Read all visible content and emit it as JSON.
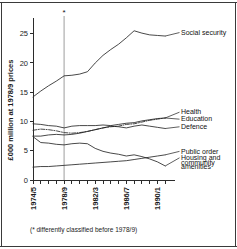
{
  "figure": {
    "footnote": "(* differently classified before 1978/9)",
    "asterisk": "*",
    "marker_note_symbol": "*"
  },
  "chart_data": {
    "type": "line",
    "title": "",
    "xlabel": "",
    "ylabel": "£000 million at 1978/9 prices",
    "xlim": [
      1974,
      1992
    ],
    "ylim": [
      0,
      27
    ],
    "yticks": [
      0,
      5,
      10,
      15,
      20,
      25
    ],
    "ytick_labels": [
      "0",
      "5",
      "10",
      "15",
      "20",
      "25"
    ],
    "x": [
      1974,
      1975,
      1976,
      1977,
      1978,
      1979,
      1980,
      1981,
      1982,
      1983,
      1984,
      1985,
      1986,
      1987,
      1988,
      1989,
      1990,
      1991
    ],
    "xtick_labels": [
      "1974/5",
      "1978/9",
      "1982/3",
      "1986/7",
      "1990/1"
    ],
    "xtick_values": [
      1974,
      1978,
      1982,
      1986,
      1990
    ],
    "grid": false,
    "legend_position": "right-inline",
    "reference_line": {
      "x": 1978,
      "label": "1978/9",
      "color": "#b9b9b9",
      "marker": "*"
    },
    "series": [
      {
        "name": "Social security",
        "style": "solid",
        "color": "#1a1a1a",
        "values": [
          14.2,
          15.2,
          16.1,
          16.9,
          17.8,
          17.9,
          18.1,
          18.5,
          20.0,
          21.3,
          22.3,
          23.2,
          24.3,
          25.5,
          25.1,
          24.8,
          24.7,
          24.6
        ]
      },
      {
        "name": "Health",
        "style": "solid",
        "color": "#1a1a1a",
        "values": [
          9.6,
          9.5,
          9.3,
          9.2,
          8.9,
          9.2,
          9.3,
          9.3,
          9.3,
          9.4,
          9.3,
          9.5,
          9.7,
          9.8,
          10.1,
          10.3,
          10.5,
          10.6
        ]
      },
      {
        "name": "Education",
        "style": "dashdot",
        "color": "#1a1a1a",
        "values": [
          8.5,
          8.7,
          8.6,
          8.4,
          8.1,
          8.0,
          8.1,
          8.3,
          8.6,
          8.9,
          9.1,
          9.2,
          9.5,
          9.6,
          9.9,
          10.2,
          10.4,
          10.6
        ]
      },
      {
        "name": "Defence",
        "style": "solid",
        "color": "#1a1a1a",
        "values": [
          7.5,
          7.5,
          7.7,
          7.8,
          7.7,
          7.8,
          8.0,
          8.3,
          8.6,
          8.9,
          9.2,
          9.1,
          8.9,
          9.2,
          9.4,
          9.2,
          9.0,
          8.8
        ]
      },
      {
        "name": "Public order",
        "style": "solid",
        "color": "#1a1a1a",
        "values": [
          2.2,
          2.3,
          2.3,
          2.4,
          2.5,
          2.6,
          2.7,
          2.8,
          2.9,
          3.0,
          3.1,
          3.2,
          3.3,
          3.5,
          3.7,
          3.9,
          4.1,
          4.3
        ]
      },
      {
        "name": "Housing and community amenities",
        "style": "solid",
        "color": "#1a1a1a",
        "values": [
          7.4,
          6.4,
          6.3,
          6.1,
          6.0,
          6.2,
          6.3,
          6.2,
          5.4,
          4.9,
          4.6,
          4.4,
          4.1,
          4.3,
          4.0,
          3.6,
          3.1,
          2.4
        ]
      }
    ],
    "annotations": [
      {
        "text": "Social security",
        "anchor_x": 1991,
        "anchor_y": 24.6,
        "label_y": 24.8
      },
      {
        "text": "Health",
        "anchor_x": 1991,
        "anchor_y": 10.6,
        "label_y": 11.2
      },
      {
        "text": "Education",
        "anchor_x": 1991,
        "anchor_y": 10.6,
        "label_y": 10.0
      },
      {
        "text": "Defence",
        "anchor_x": 1991,
        "anchor_y": 8.8,
        "label_y": 8.7
      },
      {
        "text": "Public order",
        "anchor_x": 1991,
        "anchor_y": 4.3,
        "label_y": 4.5
      },
      {
        "text": "Housing and",
        "anchor_x": 1991,
        "anchor_y": 2.4,
        "label_y": 3.4
      },
      {
        "text": "community",
        "anchor_x": null,
        "anchor_y": null,
        "label_y": 2.6
      },
      {
        "text": "amenities",
        "anchor_x": null,
        "anchor_y": null,
        "label_y": 1.8
      }
    ]
  }
}
